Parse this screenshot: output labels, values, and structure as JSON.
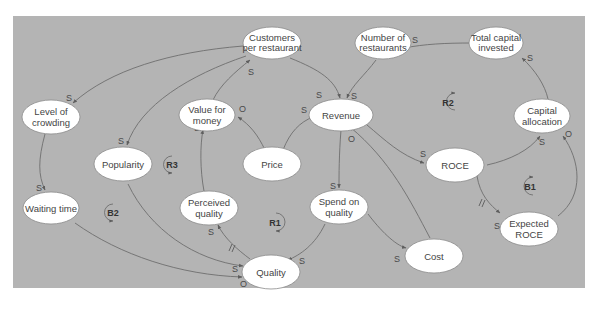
{
  "diagram": {
    "type": "causal-loop-diagram",
    "background_color": "#b4b4b4",
    "node_fill": "#ffffff",
    "nodes": [
      {
        "id": "customers",
        "lines": [
          "Customers",
          "per restaurant"
        ]
      },
      {
        "id": "num_restaurants",
        "lines": [
          "Number of",
          "restaurants"
        ]
      },
      {
        "id": "total_capital",
        "lines": [
          "Total capital",
          "invested"
        ]
      },
      {
        "id": "crowding",
        "lines": [
          "Level of",
          "crowding"
        ]
      },
      {
        "id": "value_money",
        "lines": [
          "Value for",
          "money"
        ]
      },
      {
        "id": "revenue",
        "lines": [
          "Revenue"
        ]
      },
      {
        "id": "capital_alloc",
        "lines": [
          "Capital",
          "allocation"
        ]
      },
      {
        "id": "popularity",
        "lines": [
          "Popularity"
        ]
      },
      {
        "id": "price",
        "lines": [
          "Price"
        ]
      },
      {
        "id": "roce",
        "lines": [
          "ROCE"
        ]
      },
      {
        "id": "waiting",
        "lines": [
          "Waiting time"
        ]
      },
      {
        "id": "perceived",
        "lines": [
          "Perceived",
          "quality"
        ]
      },
      {
        "id": "spend",
        "lines": [
          "Spend on",
          "quality"
        ]
      },
      {
        "id": "expected_roce",
        "lines": [
          "Expected",
          "ROCE"
        ]
      },
      {
        "id": "cost",
        "lines": [
          "Cost"
        ]
      },
      {
        "id": "quality",
        "lines": [
          "Quality"
        ]
      }
    ],
    "edges": [
      {
        "from": "customers",
        "to": "crowding",
        "polarity": "S"
      },
      {
        "from": "customers",
        "to": "popularity",
        "polarity": "S"
      },
      {
        "from": "customers",
        "to": "revenue",
        "polarity": "S"
      },
      {
        "from": "value_money",
        "to": "customers",
        "polarity": "S"
      },
      {
        "from": "price",
        "to": "value_money",
        "polarity": "O"
      },
      {
        "from": "price",
        "to": "revenue",
        "polarity": "S"
      },
      {
        "from": "num_restaurants",
        "to": "revenue",
        "polarity": "S"
      },
      {
        "from": "total_capital",
        "to": "num_restaurants",
        "polarity": "S"
      },
      {
        "from": "capital_alloc",
        "to": "total_capital",
        "polarity": "S"
      },
      {
        "from": "revenue",
        "to": "roce",
        "polarity": "S"
      },
      {
        "from": "cost",
        "to": "revenue",
        "polarity": "O"
      },
      {
        "from": "revenue",
        "to": "spend",
        "polarity": "S"
      },
      {
        "from": "roce",
        "to": "capital_alloc",
        "polarity": "S"
      },
      {
        "from": "roce",
        "to": "expected_roce",
        "polarity": "S",
        "delay": true
      },
      {
        "from": "expected_roce",
        "to": "capital_alloc",
        "polarity": "O"
      },
      {
        "from": "crowding",
        "to": "waiting",
        "polarity": "S"
      },
      {
        "from": "waiting",
        "to": "quality",
        "polarity": "O"
      },
      {
        "from": "popularity",
        "to": "quality",
        "polarity": "S"
      },
      {
        "from": "perceived",
        "to": "value_money",
        "polarity": "S"
      },
      {
        "from": "quality",
        "to": "perceived",
        "polarity": "S",
        "delay": true
      },
      {
        "from": "spend",
        "to": "quality",
        "polarity": "S"
      },
      {
        "from": "spend",
        "to": "cost",
        "polarity": "S"
      }
    ],
    "loops": [
      {
        "id": "R1",
        "label": "R1"
      },
      {
        "id": "R2",
        "label": "R2"
      },
      {
        "id": "R3",
        "label": "R3"
      },
      {
        "id": "B1",
        "label": "B1"
      },
      {
        "id": "B2",
        "label": "B2"
      }
    ],
    "polarity_labels": {
      "same": "S",
      "opposite": "O",
      "delay": "//"
    }
  }
}
